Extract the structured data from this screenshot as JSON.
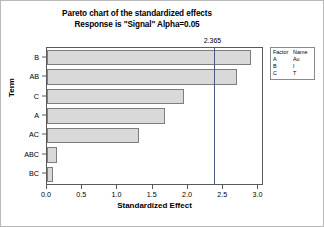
{
  "chart_data": {
    "type": "bar",
    "orientation": "horizontal",
    "title": "Pareto chart of the standardized effects",
    "subtitle": "Response is \"Signal\"  Alpha=0.05",
    "xlabel": "Standardized Effect",
    "ylabel": "Term",
    "categories": [
      "B",
      "AB",
      "C",
      "A",
      "AC",
      "ABC",
      "BC"
    ],
    "values": [
      2.9,
      2.7,
      1.95,
      1.68,
      1.3,
      0.14,
      0.08
    ],
    "xlim": [
      0.0,
      3.05
    ],
    "xticks": [
      "0.0",
      "0.5",
      "1.0",
      "1.5",
      "2.0",
      "2.5",
      "3.0"
    ],
    "xtick_values": [
      0.0,
      0.5,
      1.0,
      1.5,
      2.0,
      2.5,
      3.0
    ],
    "grid": false,
    "reference_line": {
      "value": 2.365,
      "label": "2.365"
    },
    "bar_fill_color": "#d9d9d9",
    "bar_edge_color": "#7d7d7d",
    "reference_line_color": "#4a5a86"
  },
  "legend": {
    "headers": [
      "Factor",
      "Name"
    ],
    "rows": [
      {
        "factor": "A",
        "name": "Au"
      },
      {
        "factor": "B",
        "name": "I"
      },
      {
        "factor": "C",
        "name": "T"
      }
    ]
  }
}
